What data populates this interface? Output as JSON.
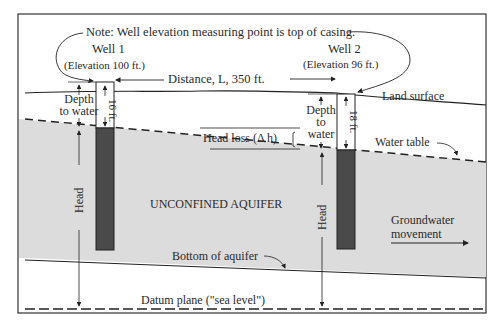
{
  "diagram": {
    "note": "Note: Well elevation measuring point is top of casing.",
    "well1": {
      "title": "Well 1",
      "elevation": "(Elevation  100 ft.)",
      "depth_label": "16 ft."
    },
    "well2": {
      "title": "Well 2",
      "elevation": "(Elevation  96 ft.)",
      "depth_label": "18 ft."
    },
    "distance": "Distance,  L, 350  ft.",
    "depth_to_water_1": [
      "Depth",
      "to water"
    ],
    "depth_to_water_2": [
      "Depth",
      "to",
      "water"
    ],
    "head_loss": "Head  loss  (Δ h)",
    "land_surface": "Land  surface",
    "water_table": "Water table",
    "aquifer": "UNCONFINED AQUIFER",
    "head": "Head",
    "groundwater_movement": [
      "Groundwater",
      "movement"
    ],
    "bottom_of_aquifer": "Bottom  of aquifer",
    "datum_plane": "Datum  plane  (\"sea  level\")",
    "colors": {
      "aquifer": "#dcdcdc",
      "casing_dark": "#4a4a4a",
      "line": "#222222"
    }
  }
}
